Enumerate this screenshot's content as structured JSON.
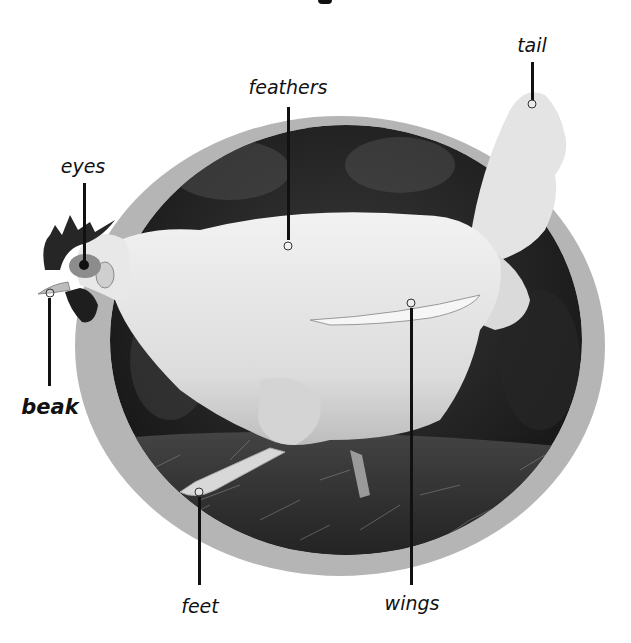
{
  "diagram": {
    "style": "greyscale photo in oval frame with callout labels",
    "colors": {
      "background": "#ffffff",
      "ring": "#b5b5b5",
      "photo_background": "#2a2a2a",
      "chicken_body": "#e6e6e6",
      "label_text": "#111111",
      "leader_line": "#111111"
    },
    "labels": [
      {
        "id": "tail",
        "text": "tail",
        "bold": false
      },
      {
        "id": "feathers",
        "text": "feathers",
        "bold": false
      },
      {
        "id": "eyes",
        "text": "eyes",
        "bold": false
      },
      {
        "id": "beak",
        "text": "beak",
        "bold": true
      },
      {
        "id": "feet",
        "text": "feet",
        "bold": false
      },
      {
        "id": "wings",
        "text": "wings",
        "bold": false
      }
    ]
  }
}
